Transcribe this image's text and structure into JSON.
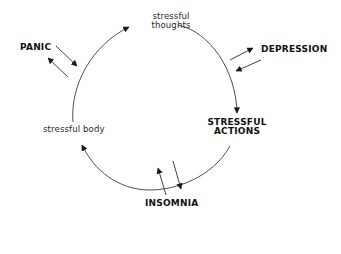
{
  "diagram": {
    "cycle_nodes": {
      "thoughts": {
        "line1": "stressful",
        "line2": "thoughts"
      },
      "actions": {
        "line1": "STRESSFUL",
        "line2": "ACTIONS"
      },
      "body": {
        "line1": "stressful body"
      }
    },
    "external_factors": {
      "panic": "PANIC",
      "depression": "DEPRESSION",
      "insomnia": "INSOMNIA"
    },
    "cycle_order": [
      "stressful thoughts",
      "STRESSFUL ACTIONS",
      "stressful body"
    ],
    "connections": [
      {
        "from": "stressful thoughts",
        "to": "STRESSFUL ACTIONS",
        "type": "cycle-arc"
      },
      {
        "from": "STRESSFUL ACTIONS",
        "to": "stressful body",
        "type": "cycle-arc"
      },
      {
        "from": "stressful body",
        "to": "stressful thoughts",
        "type": "cycle-arc"
      },
      {
        "between": [
          "PANIC",
          "cycle"
        ],
        "type": "bidirectional"
      },
      {
        "between": [
          "DEPRESSION",
          "cycle"
        ],
        "type": "bidirectional"
      },
      {
        "between": [
          "INSOMNIA",
          "cycle"
        ],
        "type": "bidirectional"
      }
    ],
    "colors": {
      "background": "#ffffff",
      "line": "#3a3a3a",
      "text": "#1a1a1a"
    }
  }
}
